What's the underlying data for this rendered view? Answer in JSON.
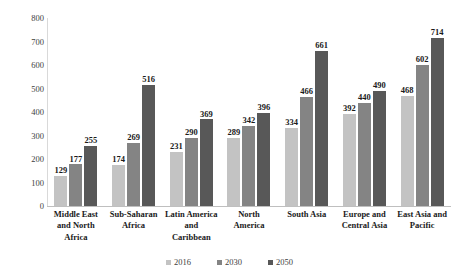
{
  "chart_data": {
    "type": "bar",
    "title": "",
    "subtitle": "",
    "xlabel": "",
    "ylabel": "",
    "ylim": [
      0,
      800
    ],
    "yticks": [
      0,
      100,
      200,
      300,
      400,
      500,
      600,
      700,
      800
    ],
    "ytick_labels": [
      "0",
      "100",
      "200",
      "300",
      "400",
      "500",
      "600",
      "700",
      "800"
    ],
    "grid": false,
    "legend_position": "bottom",
    "categories": [
      "Middle East and North Africa",
      "Sub-Saharan Africa",
      "Latin America and Caribbean",
      "North America",
      "South Asia",
      "Europe and Central Asia",
      "East Asia and Pacific"
    ],
    "category_label_lines": [
      [
        "Middle East",
        "and North",
        "Africa"
      ],
      [
        "Sub-Saharan",
        "Africa"
      ],
      [
        "Latin America",
        "and",
        "Caribbean"
      ],
      [
        "North",
        "America"
      ],
      [
        "South Asia"
      ],
      [
        "Europe and",
        "Central Asia"
      ],
      [
        "East Asia and",
        "Pacific"
      ]
    ],
    "series": [
      {
        "name": "2016",
        "color": "#c3c3c3",
        "values": [
          129,
          174,
          231,
          289,
          334,
          392,
          468
        ]
      },
      {
        "name": "2030",
        "color": "#848484",
        "values": [
          177,
          269,
          290,
          342,
          466,
          440,
          602
        ]
      },
      {
        "name": "2050",
        "color": "#585858",
        "values": [
          255,
          516,
          369,
          396,
          661,
          490,
          714
        ]
      }
    ]
  },
  "legend": {
    "items": [
      {
        "label": "2016",
        "color": "#c3c3c3"
      },
      {
        "label": "2030",
        "color": "#848484"
      },
      {
        "label": "2050",
        "color": "#585858"
      }
    ]
  },
  "colors": {
    "background": "#ffffff",
    "axis": "#bfbfbf",
    "tick_text": "#404040",
    "value_text": "#1a1a1a"
  }
}
